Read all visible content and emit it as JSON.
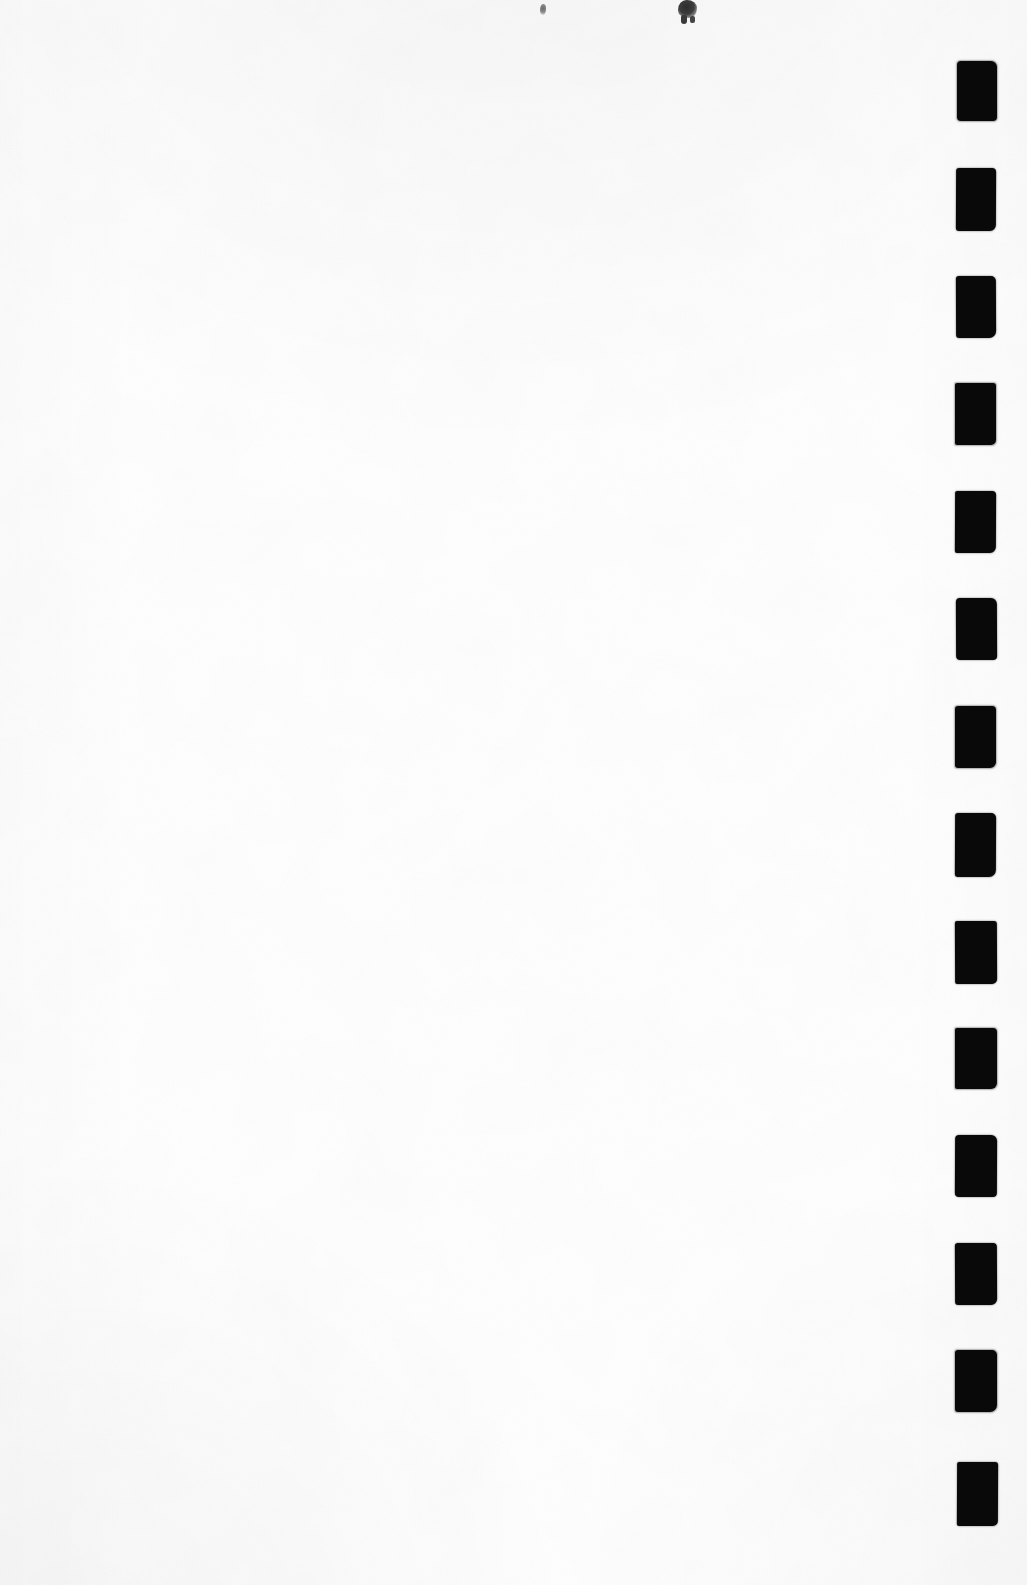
{
  "document": {
    "kind": "scanned-page",
    "page_width": 1027,
    "page_height": 1585,
    "background_color": "#fefefe",
    "body_text": "",
    "visible_text": ""
  },
  "marks": {
    "label": "index-mark-column",
    "ink_color": "#090909",
    "count": 14,
    "column_left": 955,
    "column_right": 997,
    "spacing": 107.4,
    "items": [
      {
        "index": 1,
        "x": 957,
        "y": 61,
        "w": 40,
        "h": 60
      },
      {
        "index": 2,
        "x": 956,
        "y": 168,
        "w": 40,
        "h": 63
      },
      {
        "index": 3,
        "x": 956,
        "y": 276,
        "w": 40,
        "h": 62
      },
      {
        "index": 4,
        "x": 955,
        "y": 383,
        "w": 41,
        "h": 62
      },
      {
        "index": 5,
        "x": 955,
        "y": 491,
        "w": 41,
        "h": 62
      },
      {
        "index": 6,
        "x": 956,
        "y": 598,
        "w": 41,
        "h": 62
      },
      {
        "index": 7,
        "x": 955,
        "y": 706,
        "w": 41,
        "h": 62
      },
      {
        "index": 8,
        "x": 955,
        "y": 813,
        "w": 41,
        "h": 64
      },
      {
        "index": 9,
        "x": 955,
        "y": 921,
        "w": 42,
        "h": 63
      },
      {
        "index": 10,
        "x": 955,
        "y": 1028,
        "w": 42,
        "h": 61
      },
      {
        "index": 11,
        "x": 955,
        "y": 1135,
        "w": 42,
        "h": 62
      },
      {
        "index": 12,
        "x": 955,
        "y": 1243,
        "w": 42,
        "h": 62
      },
      {
        "index": 13,
        "x": 955,
        "y": 1350,
        "w": 42,
        "h": 62
      },
      {
        "index": 14,
        "x": 957,
        "y": 1462,
        "w": 41,
        "h": 64
      }
    ]
  },
  "artifacts": {
    "label": "ink-specks",
    "items": [
      {
        "name": "artifact-large",
        "x": 678,
        "y": 0,
        "w": 19,
        "h": 18
      },
      {
        "name": "artifact-small",
        "x": 540,
        "y": 4,
        "w": 6,
        "h": 11
      }
    ]
  }
}
